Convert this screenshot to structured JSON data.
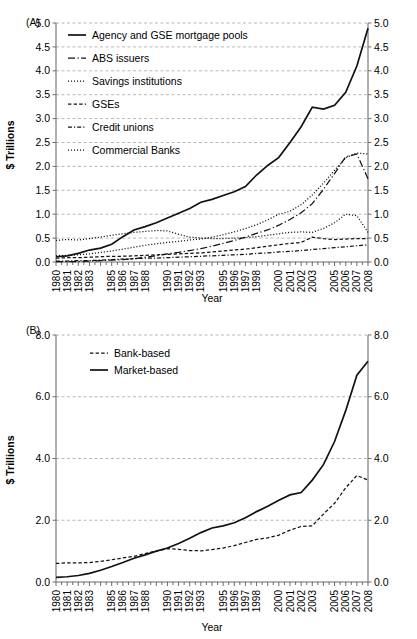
{
  "figure": {
    "panels": [
      "(A)",
      "(B)"
    ]
  },
  "chart_data": [
    {
      "type": "line",
      "panel_label": "(A)",
      "title": "",
      "xlabel": "Year",
      "ylabel": "$ Trillions",
      "xlim": [
        1980,
        2008
      ],
      "ylim": [
        0.0,
        5.0
      ],
      "ytick_labels": [
        "0.0",
        "0.5",
        "1.0",
        "1.5",
        "2.0",
        "2.5",
        "3.0",
        "3.5",
        "4.0",
        "4.5",
        "5.0"
      ],
      "ytick_values": [
        0.0,
        0.5,
        1.0,
        1.5,
        2.0,
        2.5,
        3.0,
        3.5,
        4.0,
        4.5,
        5.0
      ],
      "right_axis": true,
      "right_ytick_labels": [
        "0.0",
        "0.5",
        "1.0",
        "1.5",
        "2.0",
        "2.5",
        "3.0",
        "3.5",
        "4.0",
        "4.5",
        "5.0"
      ],
      "grid": true,
      "legend_position": "upper-left",
      "x": [
        1980,
        1981,
        1982,
        1983,
        1984,
        1985,
        1986,
        1987,
        1988,
        1989,
        1990,
        1991,
        1992,
        1993,
        1994,
        1995,
        1996,
        1997,
        1998,
        1999,
        2000,
        2001,
        2002,
        2003,
        2004,
        2005,
        2006,
        2007,
        2008
      ],
      "xtick_labels": [
        "1980",
        "1981",
        "1982",
        "1983",
        "",
        "1985",
        "1986",
        "1987",
        "1988",
        "",
        "1990",
        "1991",
        "1992",
        "1993",
        "",
        "1995",
        "1996",
        "1997",
        "1998",
        "",
        "2000",
        "2001",
        "2002",
        "2003",
        "",
        "2005",
        "2006",
        "2007",
        "2008"
      ],
      "series": [
        {
          "name": "Agency and GSE mortgage pools",
          "style": "solid",
          "width": "thick",
          "values": [
            0.11,
            0.13,
            0.18,
            0.25,
            0.29,
            0.37,
            0.53,
            0.67,
            0.74,
            0.82,
            0.92,
            1.02,
            1.12,
            1.25,
            1.31,
            1.39,
            1.47,
            1.58,
            1.82,
            2.02,
            2.19,
            2.5,
            2.83,
            3.24,
            3.2,
            3.28,
            3.55,
            4.1,
            4.89
          ]
        },
        {
          "name": "ABS issuers",
          "style": "longdot",
          "width": "thin",
          "values": [
            0.01,
            0.01,
            0.01,
            0.02,
            0.03,
            0.04,
            0.05,
            0.07,
            0.1,
            0.13,
            0.17,
            0.2,
            0.24,
            0.28,
            0.33,
            0.39,
            0.45,
            0.52,
            0.6,
            0.67,
            0.77,
            0.89,
            1.03,
            1.22,
            1.52,
            1.85,
            2.2,
            2.26,
            1.74
          ]
        },
        {
          "name": "Savings institutions",
          "style": "dots",
          "width": "thin",
          "values": [
            0.45,
            0.47,
            0.46,
            0.49,
            0.52,
            0.56,
            0.59,
            0.62,
            0.64,
            0.66,
            0.65,
            0.58,
            0.52,
            0.5,
            0.49,
            0.49,
            0.5,
            0.51,
            0.53,
            0.56,
            0.59,
            0.62,
            0.63,
            0.62,
            0.7,
            0.82,
            1.0,
            0.97,
            0.62
          ]
        },
        {
          "name": "GSEs",
          "style": "dash",
          "width": "thin",
          "values": [
            0.08,
            0.09,
            0.09,
            0.1,
            0.11,
            0.12,
            0.12,
            0.13,
            0.14,
            0.15,
            0.16,
            0.17,
            0.18,
            0.19,
            0.21,
            0.23,
            0.25,
            0.27,
            0.3,
            0.33,
            0.36,
            0.39,
            0.41,
            0.52,
            0.49,
            0.47,
            0.48,
            0.49,
            0.49
          ]
        },
        {
          "name": "Credit unions",
          "style": "dashdot",
          "width": "thin",
          "values": [
            0.02,
            0.02,
            0.03,
            0.03,
            0.04,
            0.05,
            0.06,
            0.07,
            0.08,
            0.08,
            0.09,
            0.1,
            0.11,
            0.12,
            0.13,
            0.14,
            0.15,
            0.16,
            0.18,
            0.19,
            0.21,
            0.22,
            0.24,
            0.26,
            0.28,
            0.3,
            0.32,
            0.34,
            0.36
          ]
        },
        {
          "name": "Commercial Banks",
          "style": "dots",
          "width": "thin",
          "values": [
            0.13,
            0.14,
            0.15,
            0.17,
            0.2,
            0.23,
            0.27,
            0.31,
            0.35,
            0.38,
            0.41,
            0.43,
            0.46,
            0.48,
            0.52,
            0.57,
            0.63,
            0.7,
            0.78,
            0.88,
            1.0,
            1.06,
            1.2,
            1.4,
            1.65,
            1.92,
            2.18,
            2.28,
            2.26
          ]
        }
      ]
    },
    {
      "type": "line",
      "panel_label": "(B)",
      "title": "",
      "xlabel": "Year",
      "ylabel": "$ Trillions",
      "xlim": [
        1980,
        2008
      ],
      "ylim": [
        0.0,
        8.0
      ],
      "ytick_labels": [
        "0.0",
        "2.0",
        "4.0",
        "6.0",
        "8.0"
      ],
      "ytick_values": [
        0.0,
        2.0,
        4.0,
        6.0,
        8.0
      ],
      "right_axis": true,
      "right_ytick_labels": [
        "0.0",
        "2.0",
        "4.0",
        "6.0",
        "8.0"
      ],
      "grid": true,
      "legend_position": "upper-left",
      "x": [
        1980,
        1981,
        1982,
        1983,
        1984,
        1985,
        1986,
        1987,
        1988,
        1989,
        1990,
        1991,
        1992,
        1993,
        1994,
        1995,
        1996,
        1997,
        1998,
        1999,
        2000,
        2001,
        2002,
        2003,
        2004,
        2005,
        2006,
        2007,
        2008
      ],
      "xtick_labels": [
        "1980",
        "1981",
        "1982",
        "1983",
        "",
        "1985",
        "1986",
        "1987",
        "1988",
        "",
        "1990",
        "1991",
        "1992",
        "1993",
        "",
        "1995",
        "1996",
        "1997",
        "1998",
        "",
        "2000",
        "2001",
        "2002",
        "2003",
        "",
        "2005",
        "2006",
        "2007",
        "2008"
      ],
      "series": [
        {
          "name": "Bank-based",
          "style": "dash",
          "width": "thin",
          "values": [
            0.6,
            0.62,
            0.62,
            0.63,
            0.67,
            0.72,
            0.78,
            0.83,
            0.92,
            1.0,
            1.08,
            1.06,
            1.02,
            1.01,
            1.05,
            1.1,
            1.18,
            1.28,
            1.38,
            1.43,
            1.52,
            1.68,
            1.8,
            1.82,
            2.2,
            2.55,
            3.05,
            3.45,
            3.3
          ]
        },
        {
          "name": "Market-based",
          "style": "solid",
          "width": "thick",
          "values": [
            0.15,
            0.17,
            0.21,
            0.28,
            0.38,
            0.5,
            0.63,
            0.77,
            0.88,
            1.0,
            1.1,
            1.25,
            1.42,
            1.6,
            1.75,
            1.82,
            1.92,
            2.08,
            2.28,
            2.45,
            2.65,
            2.82,
            2.9,
            3.3,
            3.8,
            4.55,
            5.55,
            6.7,
            7.15
          ]
        }
      ]
    }
  ]
}
